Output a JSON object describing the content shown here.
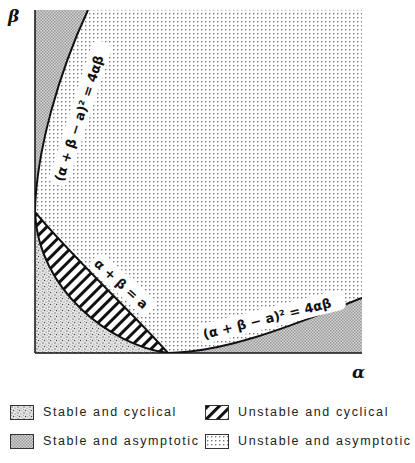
{
  "axes": {
    "x_label": "α",
    "y_label": "β"
  },
  "curve_labels": {
    "upper_left_curve": "(α + β − a)² = 4αβ",
    "lower_right_curve": "(α + β − a)² = 4αβ",
    "line": "α + β = a"
  },
  "regions": [
    {
      "name": "stable-cyclical",
      "pattern": "dense-stipple",
      "location": "bottom-left corner below hatched band"
    },
    {
      "name": "unstable-cyclical",
      "pattern": "diagonal-hatch",
      "location": "band between curve and line α+β=a"
    },
    {
      "name": "stable-asymptotic",
      "pattern": "fine-checker-gray",
      "location": "top-left and bottom-right corners outside curve"
    },
    {
      "name": "unstable-asymptotic",
      "pattern": "dotted",
      "location": "large interior region"
    }
  ],
  "legend": {
    "items": [
      {
        "label": "Stable and cyclical",
        "pattern": "stipple"
      },
      {
        "label": "Unstable and cyclical",
        "pattern": "hatch"
      },
      {
        "label": "Stable and asymptotic",
        "pattern": "checker"
      },
      {
        "label": "Unstable and asymptotic",
        "pattern": "dots"
      }
    ]
  }
}
